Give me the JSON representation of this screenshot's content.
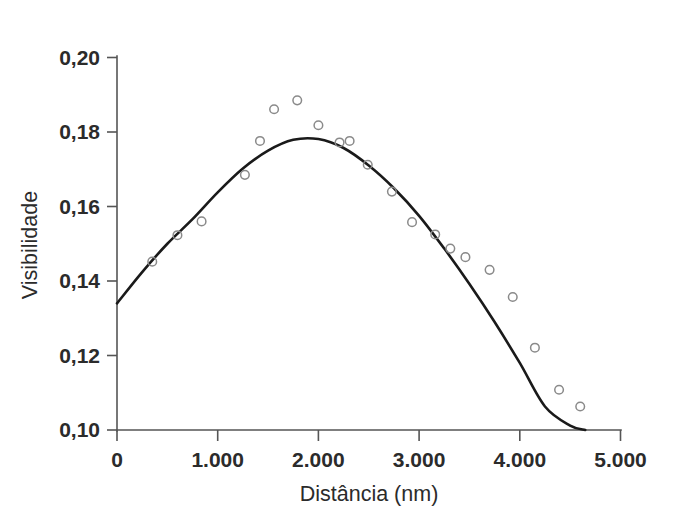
{
  "chart_data": {
    "type": "scatter",
    "title": "",
    "xlabel": "Distância (nm)",
    "ylabel": "Visibilidade",
    "xlim": [
      0,
      5000
    ],
    "ylim": [
      0.1,
      0.2
    ],
    "grid": false,
    "legend": null,
    "x_tick_labels": [
      "0",
      "1.000",
      "2.000",
      "3.000",
      "4.000",
      "5.000"
    ],
    "x_tick_values": [
      0,
      1000,
      2000,
      3000,
      4000,
      5000
    ],
    "y_tick_labels": [
      "0,10",
      "0,12",
      "0,14",
      "0,16",
      "0,18",
      "0,20"
    ],
    "y_tick_values": [
      0.1,
      0.12,
      0.14,
      0.16,
      0.18,
      0.2
    ],
    "decimal_separator": ",",
    "thousands_separator": ".",
    "series": [
      {
        "name": "Dados medidos",
        "type": "scatter",
        "marker": "open-circle",
        "marker_color": "#8a8a8a",
        "x": [
          350,
          600,
          840,
          1270,
          1420,
          1560,
          1790,
          2000,
          2210,
          2310,
          2490,
          2730,
          2930,
          3160,
          3310,
          3460,
          3700,
          3930,
          4150,
          4390,
          4600
        ],
        "y": [
          0.1452,
          0.1523,
          0.156,
          0.1685,
          0.1776,
          0.1861,
          0.1885,
          0.1818,
          0.1772,
          0.1776,
          0.1712,
          0.164,
          0.1558,
          0.1525,
          0.1487,
          0.1464,
          0.143,
          0.1357,
          0.1221,
          0.1108,
          0.1063
        ]
      },
      {
        "name": "Ajuste",
        "type": "line",
        "line_color": "#1a1a1a",
        "x": [
          0,
          250,
          500,
          750,
          1000,
          1250,
          1500,
          1750,
          2000,
          2250,
          2500,
          2750,
          3000,
          3250,
          3500,
          3750,
          4000,
          4250,
          4500,
          4650
        ],
        "y": [
          0.134,
          0.1424,
          0.15,
          0.1566,
          0.1638,
          0.1702,
          0.175,
          0.1779,
          0.1781,
          0.1757,
          0.171,
          0.1649,
          0.1575,
          0.1487,
          0.1392,
          0.129,
          0.118,
          0.1063,
          0.1012,
          0.1
        ]
      }
    ]
  },
  "axes": {
    "x_axis_title": "Distância (nm)",
    "y_axis_title": "Visibilidade"
  },
  "colors": {
    "curve": "#1a1a1a",
    "marker_stroke": "#8a8a8a",
    "axis": "#555555",
    "text": "#2b2b2b",
    "background": "#ffffff"
  }
}
